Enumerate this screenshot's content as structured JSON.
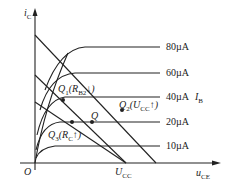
{
  "diagram": {
    "axes": {
      "y_label": "i",
      "y_sub": "C",
      "x_label": "u",
      "x_sub": "CE",
      "origin": "O"
    },
    "curves": [
      {
        "label": "80µA"
      },
      {
        "label": "60µA"
      },
      {
        "label": "40µA"
      },
      {
        "label": "20µA"
      },
      {
        "label": "10µA"
      }
    ],
    "curve_family_label": "I",
    "curve_family_sub": "B",
    "points": {
      "q": "Q",
      "q1": "Q",
      "q1_sub": "1",
      "q1_cond": "(R",
      "q1_cond_sub": "B2",
      "q1_arrow": "↓)",
      "q2": "Q",
      "q2_sub": "2",
      "q2_cond": "(U",
      "q2_cond_sub": "CC",
      "q2_arrow": "↑)",
      "q3": "Q",
      "q3_sub": "3",
      "q3_cond": "(R",
      "q3_cond_sub": "C",
      "q3_arrow": "↑)"
    },
    "ucc_label": "U",
    "ucc_sub": "CC"
  }
}
